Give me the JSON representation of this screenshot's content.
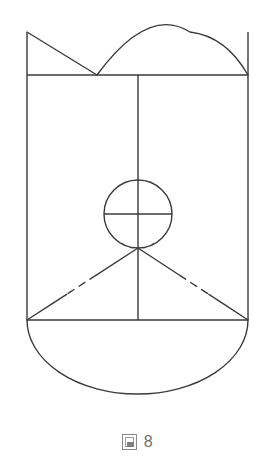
{
  "figure": {
    "caption_glyph": "圖",
    "caption_glyph_name": "tofu-box-glyph",
    "caption_number": "8",
    "caption_full": "圖 8",
    "alt_text": "Geometric construction: a vertical rounded body with a top arc, an inscribed circle with crossed diameters, and two dashed diagonal chords meeting below the circle."
  },
  "style": {
    "stroke_color": "#3a3a3a",
    "background_color": "#ffffff",
    "caption_color": "#6f6f6f",
    "stroke_width": 1.4
  },
  "geometry": {
    "canvas": {
      "width": 275,
      "height": 470
    },
    "left_x": 27,
    "right_x": 248,
    "center_x": 138,
    "top_y": 32,
    "shoulder_y": 75,
    "waist_y": 320,
    "bottom_y": 394,
    "circle": {
      "cx": 138,
      "cy": 214,
      "r": 34
    },
    "v_apex": {
      "x": 138,
      "y": 248
    },
    "arc_valley": {
      "x": 97,
      "y": 75
    },
    "arc_apex": {
      "x": 190,
      "y": 32
    }
  },
  "elements": {
    "left_vertical_label": "left vertical edge",
    "right_vertical_label": "right vertical edge",
    "center_vertical_label": "center axis line",
    "shoulder_line_label": "upper horizontal chord",
    "waist_line_label": "lower horizontal chord",
    "top_arc_label": "upper curved arc",
    "left_diagonal_label": "upper left diagonal",
    "circle_label": "inscribed circle",
    "circle_h_diameter_label": "circle horizontal diameter",
    "left_chord_label": "lower left dashed chord",
    "right_chord_label": "lower right dashed chord",
    "bottom_arc_label": "bottom semicircular arc"
  }
}
